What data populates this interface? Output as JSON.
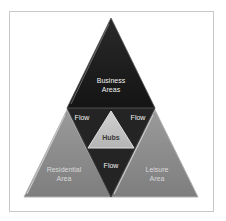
{
  "diagram": {
    "type": "triangle-pyramid",
    "nodes": {
      "top": {
        "label_line1": "Business",
        "label_line2": "Areas"
      },
      "left": {
        "label_line1": "Residential",
        "label_line2": "Area"
      },
      "right": {
        "label_line1": "Leisure",
        "label_line2": "Area"
      },
      "center": {
        "label": "Hubs"
      }
    },
    "flows": [
      {
        "label": "Flow",
        "position": "upper-left"
      },
      {
        "label": "Flow",
        "position": "upper-right"
      },
      {
        "label": "Flow",
        "position": "bottom"
      }
    ],
    "colors": {
      "top_fill": "#1e1e1e",
      "inner_fill": "#262626",
      "side_fill": "#8c8c8c",
      "hub_fill": "#c4c4c4",
      "frame_border": "#c8c8c8"
    }
  }
}
